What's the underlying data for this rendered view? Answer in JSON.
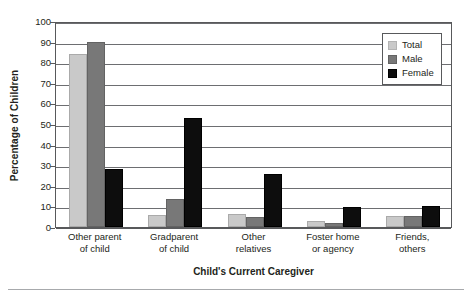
{
  "chart_data": {
    "type": "bar",
    "title": "",
    "xlabel": "Child's Current Caregiver",
    "ylabel": "Percentage of Children",
    "ylim": [
      0,
      100
    ],
    "ytick_step": 10,
    "yticks": [
      100,
      90,
      80,
      70,
      60,
      50,
      40,
      30,
      20,
      10,
      0
    ],
    "grid": true,
    "legend_position": "top-right",
    "categories": [
      "Other parent of child",
      "Gradparent of child",
      "Other relatives",
      "Foster home or agency",
      "Friends, others"
    ],
    "category_lines": [
      [
        "Other parent",
        "of child"
      ],
      [
        "Gradparent",
        "of child"
      ],
      [
        "Other",
        "relatives"
      ],
      [
        "Foster home",
        "or agency"
      ],
      [
        "Friends,",
        "others"
      ]
    ],
    "series": [
      {
        "name": "Total",
        "color": "#c9c9c9",
        "values": [
          84,
          6,
          6.5,
          3,
          5.5
        ]
      },
      {
        "name": "Male",
        "color": "#787878",
        "values": [
          90,
          13.5,
          5,
          2,
          5.5
        ]
      },
      {
        "name": "Female",
        "color": "#0d0d0d",
        "values": [
          28,
          53,
          25.5,
          9.5,
          10
        ]
      }
    ]
  },
  "legend": {
    "items": [
      {
        "label": "Total"
      },
      {
        "label": "Male"
      },
      {
        "label": "Female"
      }
    ]
  }
}
